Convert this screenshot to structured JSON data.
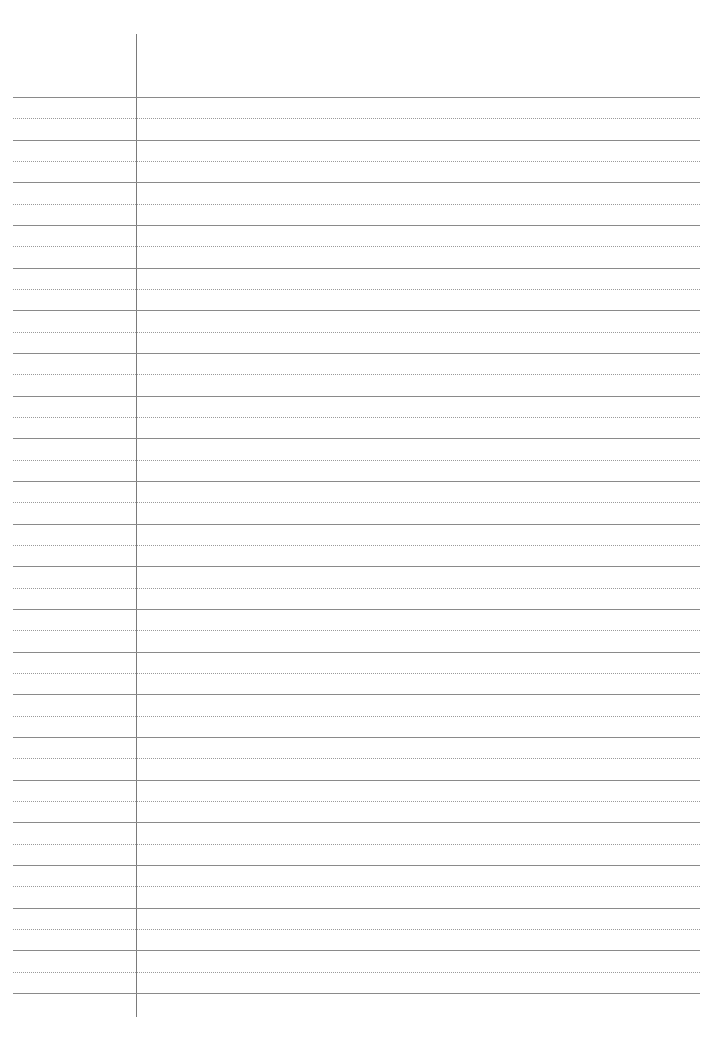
{
  "page": {
    "type": "ruled-notebook-paper",
    "background": "#ffffff",
    "rule_color": "#8a8a8a",
    "dotted_rule_color": "#9a9a9a",
    "margin_line_color": "#7a7a7a",
    "solid_line_count": 22,
    "dotted_line_count": 21,
    "first_line_y": 97,
    "line_pitch": 42.67,
    "text_content": []
  }
}
